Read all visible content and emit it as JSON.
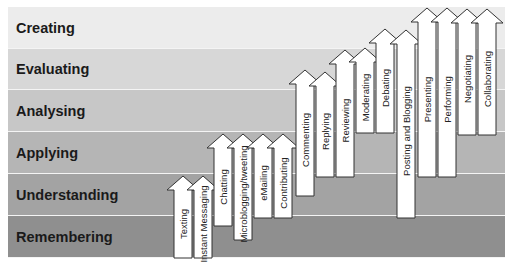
{
  "diagram": {
    "type": "bloom-taxonomy-staircase",
    "levels": [
      {
        "label": "Creating",
        "color": "#ececec",
        "top": 7,
        "height": 42
      },
      {
        "label": "Evaluating",
        "color": "#d7d7d7",
        "top": 49,
        "height": 41
      },
      {
        "label": "Analysing",
        "color": "#c7c7c7",
        "top": 90,
        "height": 42
      },
      {
        "label": "Applying",
        "color": "#b5b5b5",
        "top": 132,
        "height": 42
      },
      {
        "label": "Understanding",
        "color": "#a3a3a3",
        "top": 174,
        "height": 42
      },
      {
        "label": "Remembering",
        "color": "#8f8f8f",
        "top": 216,
        "height": 42
      }
    ],
    "arrows": [
      {
        "label": "Texting",
        "x": 174,
        "tip": 176,
        "bottom": 258
      },
      {
        "label": "Instant Messaging",
        "x": 194,
        "tip": 176,
        "bottom": 258
      },
      {
        "label": "Chatting",
        "x": 214,
        "tip": 134,
        "bottom": 226
      },
      {
        "label": "Microblogging/tweeting",
        "x": 234,
        "tip": 134,
        "bottom": 240
      },
      {
        "label": "eMailing",
        "x": 254,
        "tip": 134,
        "bottom": 218
      },
      {
        "label": "Contributing",
        "x": 274,
        "tip": 134,
        "bottom": 218
      },
      {
        "label": "Commenting",
        "x": 296,
        "tip": 70,
        "bottom": 196
      },
      {
        "label": "Replying",
        "x": 316,
        "tip": 72,
        "bottom": 177
      },
      {
        "label": "Reviewing",
        "x": 336,
        "tip": 50,
        "bottom": 177
      },
      {
        "label": "Moderating",
        "x": 356,
        "tip": 48,
        "bottom": 133
      },
      {
        "label": "Debating",
        "x": 376,
        "tip": 29,
        "bottom": 133
      },
      {
        "label": "Posting and Blogging",
        "x": 397,
        "tip": 30,
        "bottom": 218
      },
      {
        "label": "Presenting",
        "x": 418,
        "tip": 8,
        "bottom": 177
      },
      {
        "label": "Performing",
        "x": 438,
        "tip": 8,
        "bottom": 177
      },
      {
        "label": "Negotiating",
        "x": 458,
        "tip": 9,
        "bottom": 135
      },
      {
        "label": "Collaborating",
        "x": 478,
        "tip": 9,
        "bottom": 135
      }
    ],
    "arrow_style": {
      "fill": "#ffffff",
      "stroke": "#333333",
      "shaft_width": 18,
      "head_width": 32,
      "head_height": 14
    }
  }
}
